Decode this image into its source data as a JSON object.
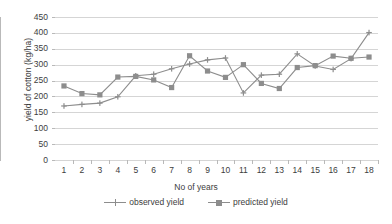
{
  "chart_data": {
    "type": "line",
    "title": "",
    "xlabel": "No of years",
    "ylabel": "yield of cotton (kg/ha)",
    "categories": [
      1,
      2,
      3,
      4,
      5,
      6,
      7,
      8,
      9,
      10,
      11,
      12,
      13,
      14,
      15,
      16,
      17,
      18
    ],
    "x_tick_labels": [
      "1",
      "2",
      "3",
      "4",
      "5",
      "6",
      "7",
      "8",
      "9",
      "10",
      "11",
      "12",
      "13",
      "14",
      "15",
      "16",
      "17",
      "18"
    ],
    "y_tick_labels": [
      "0",
      "50",
      "100",
      "150",
      "200",
      "250",
      "300",
      "350",
      "400",
      "450"
    ],
    "y_ticks": [
      0,
      50,
      100,
      150,
      200,
      250,
      300,
      350,
      400,
      450
    ],
    "ylim": [
      0,
      450
    ],
    "xlim": [
      0.5,
      18.5
    ],
    "grid": true,
    "legend_position": "bottom",
    "series": [
      {
        "name": "observed yield",
        "marker": "plus",
        "color": "#8d8d8d",
        "values": [
          170,
          175,
          179,
          199,
          265,
          270,
          287,
          302,
          315,
          321,
          211,
          267,
          270,
          334,
          296,
          285,
          319,
          401
        ]
      },
      {
        "name": "predicted yield",
        "marker": "square",
        "color": "#8d8d8d",
        "values": [
          233,
          209,
          205,
          261,
          263,
          252,
          228,
          328,
          280,
          260,
          300,
          241,
          225,
          291,
          297,
          327,
          320,
          324
        ]
      }
    ]
  },
  "legend": {
    "items": [
      {
        "label": "observed yield"
      },
      {
        "label": "predicted yield"
      }
    ]
  },
  "axes": {
    "x_title": "No of years",
    "y_title": "yield of cotton (kg/ha)"
  },
  "colors": {
    "series": "#8d8d8d",
    "grid": "#d5d5d5",
    "axis": "#b9b9b9",
    "text": "#3d3d3d",
    "background": "#ffffff"
  }
}
